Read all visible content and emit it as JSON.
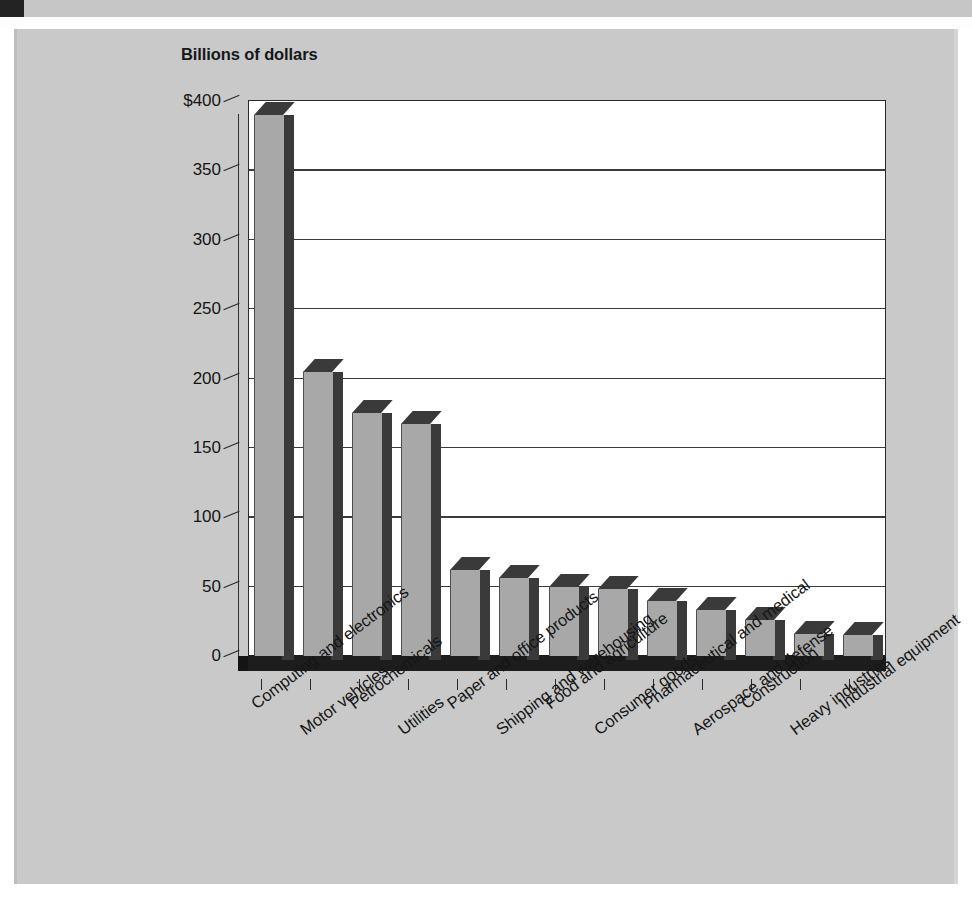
{
  "chart_data": {
    "type": "bar",
    "title": "Billions of dollars",
    "xlabel": "",
    "ylabel": "Billions of dollars",
    "ylim": [
      0,
      400
    ],
    "ytick_labels": [
      "$400",
      "350",
      "300",
      "250",
      "200",
      "150",
      "100",
      "50",
      "0"
    ],
    "ytick_values": [
      400,
      350,
      300,
      250,
      200,
      150,
      100,
      50,
      0
    ],
    "grid": true,
    "legend": "none",
    "style": "3d-column",
    "categories": [
      "Computing and electronics",
      "Motor vehicles",
      "Petrochemicals",
      "Utilities",
      "Paper and office products",
      "Shipping and warehousing",
      "Food and agriculture",
      "Consumer goods",
      "Pharmaceutical and medical",
      "Aerospace and defense",
      "Construction",
      "Heavy industries",
      "Industrial equipment"
    ],
    "values": [
      390,
      205,
      175,
      167,
      62,
      56,
      50,
      48,
      40,
      33,
      26,
      16,
      15
    ]
  },
  "colors": {
    "panel_background": "#c9c9c9",
    "plot_background": "#ffffff",
    "bar_face": "#a8a8a8",
    "bar_shadow": "#3a3a3a",
    "axis": "#2a2a2a",
    "text": "#151515",
    "strip": "#c6c6c6",
    "strip_marker": "#232323"
  }
}
